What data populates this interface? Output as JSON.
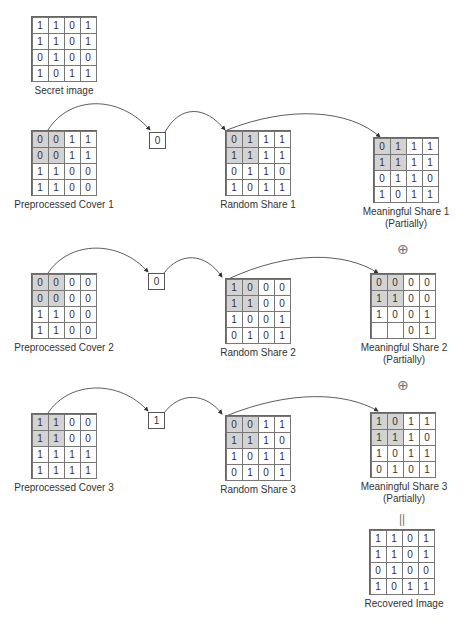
{
  "secret": {
    "label": "Secret image",
    "cells": [
      [
        1,
        1,
        0,
        1
      ],
      [
        1,
        1,
        0,
        1
      ],
      [
        0,
        1,
        0,
        0
      ],
      [
        1,
        0,
        1,
        1
      ]
    ]
  },
  "rows": [
    {
      "cover": {
        "label": "Preprocessed Cover 1",
        "cells": [
          [
            0,
            0,
            1,
            1
          ],
          [
            0,
            0,
            1,
            1
          ],
          [
            1,
            1,
            0,
            0
          ],
          [
            1,
            1,
            0,
            0
          ]
        ]
      },
      "bit": "0",
      "random": {
        "label": "Random Share 1",
        "cells": [
          [
            0,
            1,
            1,
            1
          ],
          [
            1,
            1,
            1,
            1
          ],
          [
            0,
            1,
            1,
            0
          ],
          [
            1,
            0,
            1,
            1
          ]
        ]
      },
      "meaningful": {
        "label": "Meaningful Share 1",
        "sublabel": "(Partially)",
        "cells": [
          [
            0,
            1,
            1,
            1
          ],
          [
            1,
            1,
            1,
            1
          ],
          [
            0,
            1,
            1,
            0
          ],
          [
            1,
            0,
            1,
            1
          ]
        ]
      }
    },
    {
      "cover": {
        "label": "Preprocessed Cover 2",
        "cells": [
          [
            0,
            0,
            0,
            0
          ],
          [
            0,
            0,
            0,
            0
          ],
          [
            1,
            1,
            0,
            0
          ],
          [
            1,
            1,
            0,
            0
          ]
        ]
      },
      "bit": "0",
      "random": {
        "label": "Random Share 2",
        "cells": [
          [
            1,
            0,
            0,
            0
          ],
          [
            1,
            1,
            0,
            0
          ],
          [
            1,
            0,
            0,
            1
          ],
          [
            0,
            1,
            0,
            1
          ]
        ]
      },
      "meaningful": {
        "label": "Meaningful Share 2",
        "sublabel": "(Partially)",
        "cells": [
          [
            0,
            0,
            0,
            0
          ],
          [
            1,
            1,
            0,
            0
          ],
          [
            1,
            0,
            0,
            1
          ],
          [
            "",
            "",
            0,
            1
          ]
        ]
      }
    },
    {
      "cover": {
        "label": "Preprocessed Cover 3",
        "cells": [
          [
            1,
            1,
            0,
            0
          ],
          [
            1,
            1,
            0,
            0
          ],
          [
            1,
            1,
            1,
            1
          ],
          [
            1,
            1,
            1,
            1
          ]
        ]
      },
      "bit": "1",
      "random": {
        "label": "Random Share 3",
        "cells": [
          [
            0,
            0,
            1,
            1
          ],
          [
            1,
            1,
            1,
            0
          ],
          [
            1,
            0,
            1,
            1
          ],
          [
            0,
            1,
            0,
            1
          ]
        ]
      },
      "meaningful": {
        "label": "Meaningful Share 3",
        "sublabel": "(Partially)",
        "cells": [
          [
            1,
            0,
            1,
            1
          ],
          [
            1,
            1,
            1,
            0
          ],
          [
            1,
            0,
            1,
            1
          ],
          [
            0,
            1,
            0,
            1
          ]
        ]
      }
    }
  ],
  "operators": {
    "xor_symbol": "⊕",
    "equals_symbol": "||"
  },
  "recovered": {
    "label": "Recovered Image",
    "cells": [
      [
        1,
        1,
        0,
        1
      ],
      [
        1,
        1,
        0,
        1
      ],
      [
        0,
        1,
        0,
        0
      ],
      [
        1,
        0,
        1,
        1
      ]
    ]
  },
  "colors": {
    "shade": "#d3d3d3",
    "line": "#555555"
  }
}
